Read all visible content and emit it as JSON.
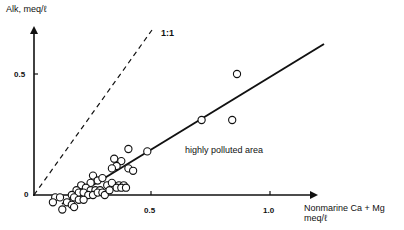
{
  "chart_data": {
    "type": "scatter",
    "title": "",
    "xlabel": "Nonmarine Ca + Mg meq/ℓ",
    "ylabel": "Alk, meq/ℓ",
    "xlim": [
      0,
      1.3
    ],
    "ylim": [
      -0.05,
      0.75
    ],
    "x_ticks": [
      {
        "value": 0.5,
        "label": "0.5"
      },
      {
        "value": 1.0,
        "label": "1.0"
      }
    ],
    "y_ticks": [
      {
        "value": 0.5,
        "label": "0.5"
      }
    ],
    "origin_label": "0",
    "grid": false,
    "legend": null,
    "series": [
      {
        "name": "observations",
        "marker": "open-circle",
        "points": [
          [
            0.86,
            0.5
          ],
          [
            0.71,
            0.31
          ],
          [
            0.84,
            0.31
          ],
          [
            0.48,
            0.18
          ],
          [
            0.4,
            0.19
          ],
          [
            0.34,
            0.15
          ],
          [
            0.37,
            0.14
          ],
          [
            0.35,
            0.12
          ],
          [
            0.33,
            0.11
          ],
          [
            0.4,
            0.11
          ],
          [
            0.42,
            0.1
          ],
          [
            0.25,
            0.08
          ],
          [
            0.27,
            0.06
          ],
          [
            0.29,
            0.07
          ],
          [
            0.24,
            0.05
          ],
          [
            0.31,
            0.04
          ],
          [
            0.33,
            0.05
          ],
          [
            0.36,
            0.04
          ],
          [
            0.38,
            0.04
          ],
          [
            0.35,
            0.03
          ],
          [
            0.37,
            0.03
          ],
          [
            0.39,
            0.03
          ],
          [
            0.2,
            0.04
          ],
          [
            0.22,
            0.03
          ],
          [
            0.24,
            0.02
          ],
          [
            0.26,
            0.02
          ],
          [
            0.28,
            0.02
          ],
          [
            0.18,
            0.02
          ],
          [
            0.19,
            0.01
          ],
          [
            0.21,
            0.01
          ],
          [
            0.23,
            0.0
          ],
          [
            0.25,
            0.0
          ],
          [
            0.27,
            0.01
          ],
          [
            0.29,
            0.01
          ],
          [
            0.3,
            0.0
          ],
          [
            0.32,
            0.02
          ],
          [
            0.16,
            0.0
          ],
          [
            0.17,
            -0.01
          ],
          [
            0.19,
            -0.02
          ],
          [
            0.21,
            -0.02
          ],
          [
            0.09,
            -0.01
          ],
          [
            0.11,
            -0.01
          ],
          [
            0.08,
            -0.03
          ],
          [
            0.14,
            -0.03
          ],
          [
            0.16,
            -0.04
          ],
          [
            0.17,
            -0.05
          ],
          [
            0.12,
            -0.06
          ]
        ]
      }
    ],
    "lines": [
      {
        "name": "regression",
        "style": "solid",
        "from": [
          0.12,
          -0.04
        ],
        "to": [
          1.23,
          0.62
        ]
      },
      {
        "name": "1:1",
        "style": "dashed",
        "from": [
          0.0,
          0.0
        ],
        "to": [
          0.5,
          0.68
        ]
      }
    ],
    "annotations": [
      {
        "text": "1:1",
        "near": "dashed line top"
      },
      {
        "text": "highly polluted area",
        "x": 0.72,
        "y": 0.2
      }
    ]
  },
  "labels": {
    "y_axis": "Alk, meq/ℓ",
    "x_axis_line1": "Nonmarine Ca + Mg",
    "x_axis_line2": "meq/ℓ",
    "ratio": "1:1",
    "annotation": "highly polluted area",
    "origin": "0",
    "y_tick_05": "0.5",
    "x_tick_05": "0.5",
    "x_tick_10": "1.0"
  }
}
